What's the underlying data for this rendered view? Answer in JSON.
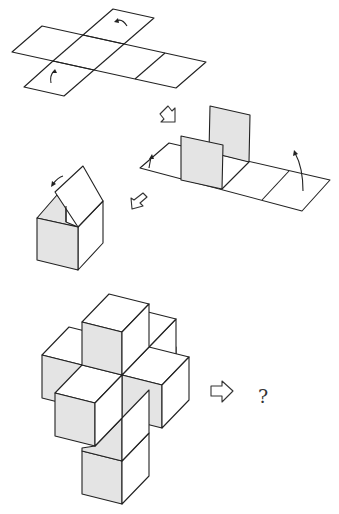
{
  "diagram": {
    "colors": {
      "line": "#222222",
      "shaded_face": "#e4e4e4",
      "background": "#ffffff"
    },
    "steps": [
      {
        "id": "flat-net",
        "label": "Flat cross-shaped cube net (6 squares) with fold arrows"
      },
      {
        "id": "partial-fold",
        "label": "Two side panels folded up, fold arrows on end flaps"
      },
      {
        "id": "box-closing",
        "label": "Box with lid closing"
      },
      {
        "id": "cube-cross",
        "label": "3D cross of cubes"
      }
    ],
    "result": {
      "question_mark": "?"
    }
  }
}
